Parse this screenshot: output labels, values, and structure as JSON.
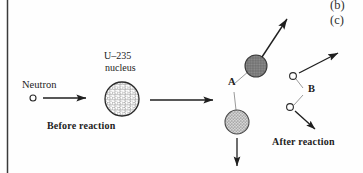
{
  "figure": {
    "part_labels": {
      "b": "(b)",
      "c": "(c)"
    },
    "stage_labels": {
      "before": "Before reaction",
      "after": "After reaction"
    },
    "annotations": {
      "neutron": "Neutron",
      "nucleus_line1": "U–235",
      "nucleus_line2": "nucleus",
      "point_a": "A",
      "point_b": "B"
    },
    "colors": {
      "ink": "#1a1a1a",
      "rule": "#3a3a3a",
      "fragment_dark": "#7e7e7e",
      "fragment_light": "#b9b9b9",
      "thin_link": "#9a9a9a",
      "background": "#fefefe"
    },
    "elements": {
      "left_rule": {
        "x": 7,
        "y1": 0,
        "y2": 173
      },
      "incoming_neutron": {
        "cx": 33,
        "cy": 98,
        "r": 3
      },
      "incoming_arrow": {
        "x1": 42,
        "y1": 98,
        "x2": 88,
        "y2": 98
      },
      "u235_nucleus": {
        "cx": 122,
        "cy": 99,
        "r": 17
      },
      "transition_arrow": {
        "x1": 148,
        "y1": 100,
        "x2": 215,
        "y2": 100
      },
      "vertex_a": {
        "x": 233,
        "y": 88
      },
      "fragment_upper": {
        "cx": 256,
        "cy": 66,
        "r": 11
      },
      "fragment_lower": {
        "cx": 237,
        "cy": 122,
        "r": 12
      },
      "fragment_upper_arrow": {
        "x1": 263,
        "y1": 58,
        "x2": 288,
        "y2": 18
      },
      "fragment_lower_arrow": {
        "x1": 237,
        "y1": 140,
        "x2": 237,
        "y2": 168
      },
      "vertex_b": {
        "x": 306,
        "y": 92
      },
      "neutron_b_upper": {
        "cx": 294,
        "cy": 76,
        "r": 3.4
      },
      "neutron_b_lower": {
        "cx": 291,
        "cy": 107,
        "r": 3.4
      },
      "neutron_b_upper_arrow": {
        "x1": 300,
        "y1": 72,
        "x2": 340,
        "y2": 52
      },
      "neutron_b_lower_arrow": {
        "x1": 296,
        "y1": 112,
        "x2": 316,
        "y2": 131
      }
    }
  }
}
